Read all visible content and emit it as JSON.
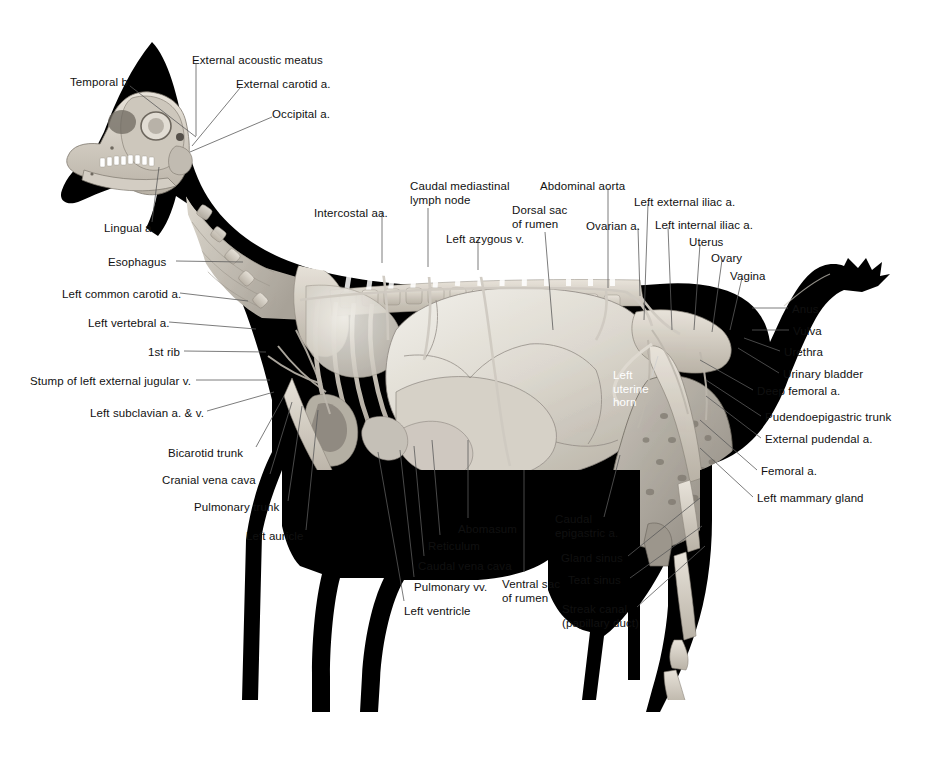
{
  "figure": {
    "view": "left lateral",
    "background_color": "#ffffff",
    "leader_color": "#5a5a5a",
    "text_color": "#111111",
    "white_text_color": "#ffffff"
  },
  "labels": [
    {
      "id": "temporal-b",
      "text": "Temporal b.",
      "x": 70,
      "y": 76,
      "align": "left",
      "tip_x": 196,
      "tip_y": 137,
      "anchor_x": 130,
      "anchor_y": 86
    },
    {
      "id": "external-acoustic-meatus",
      "text": "External acoustic meatus",
      "x": 192,
      "y": 54,
      "align": "left",
      "tip_x": 196,
      "tip_y": 136,
      "anchor_x": 196,
      "anchor_y": 64
    },
    {
      "id": "external-carotid-a",
      "text": "External carotid a.",
      "x": 236,
      "y": 78,
      "align": "left",
      "tip_x": 192,
      "tip_y": 146,
      "anchor_x": 240,
      "anchor_y": 88
    },
    {
      "id": "occipital-a",
      "text": "Occipital a.",
      "x": 272,
      "y": 108,
      "align": "left",
      "tip_x": 190,
      "tip_y": 152,
      "anchor_x": 272,
      "anchor_y": 117
    },
    {
      "id": "lingual-a",
      "text": "Lingual a.",
      "x": 104,
      "y": 222,
      "align": "left",
      "tip_x": 159,
      "tip_y": 167,
      "anchor_x": 152,
      "anchor_y": 222
    },
    {
      "id": "esophagus",
      "text": "Esophagus",
      "x": 108,
      "y": 256,
      "align": "left",
      "tip_x": 243,
      "tip_y": 262,
      "anchor_x": 176,
      "anchor_y": 261
    },
    {
      "id": "left-common-carotid-a",
      "text": "Left common carotid a.",
      "x": 62,
      "y": 288,
      "align": "left",
      "tip_x": 248,
      "tip_y": 301,
      "anchor_x": 180,
      "anchor_y": 293
    },
    {
      "id": "left-vertebral-a",
      "text": "Left vertebral a.",
      "x": 88,
      "y": 317,
      "align": "left",
      "tip_x": 256,
      "tip_y": 329,
      "anchor_x": 169,
      "anchor_y": 322
    },
    {
      "id": "1st-rib",
      "text": "1st rib",
      "x": 148,
      "y": 346,
      "align": "left",
      "tip_x": 266,
      "tip_y": 352,
      "anchor_x": 184,
      "anchor_y": 351
    },
    {
      "id": "stump-left-ext-jugular-v",
      "text": "Stump of left external jugular v.",
      "x": 30,
      "y": 375,
      "align": "left",
      "tip_x": 270,
      "tip_y": 380,
      "anchor_x": 196,
      "anchor_y": 380
    },
    {
      "id": "left-subclavian-a-v",
      "text": "Left subclavian a. & v.",
      "x": 90,
      "y": 407,
      "align": "left",
      "tip_x": 274,
      "tip_y": 392,
      "anchor_x": 207,
      "anchor_y": 411
    },
    {
      "id": "bicarotid-trunk",
      "text": "Bicarotid trunk",
      "x": 168,
      "y": 447,
      "align": "left",
      "tip_x": 284,
      "tip_y": 396,
      "anchor_x": 256,
      "anchor_y": 447
    },
    {
      "id": "cranial-vena-cava",
      "text": "Cranial vena cava",
      "x": 162,
      "y": 474,
      "align": "left",
      "tip_x": 292,
      "tip_y": 402,
      "anchor_x": 270,
      "anchor_y": 474
    },
    {
      "id": "pulmonary-trunk",
      "text": "Pulmonary trunk",
      "x": 194,
      "y": 501,
      "align": "left",
      "tip_x": 302,
      "tip_y": 406,
      "anchor_x": 288,
      "anchor_y": 501
    },
    {
      "id": "left-auricle",
      "text": "Left auricle",
      "x": 246,
      "y": 530,
      "align": "left",
      "tip_x": 318,
      "tip_y": 410,
      "anchor_x": 306,
      "anchor_y": 530
    },
    {
      "id": "intercostal-aa",
      "text": "Intercostal aa.",
      "x": 314,
      "y": 207,
      "align": "left",
      "tip_x": 382,
      "tip_y": 263,
      "anchor_x": 382,
      "anchor_y": 212
    },
    {
      "id": "caudal-mediastinal-lymph-node",
      "text": "Caudal mediastinal\nlymph node",
      "x": 410,
      "y": 180,
      "align": "left",
      "tip_x": 428,
      "tip_y": 267,
      "anchor_x": 428,
      "anchor_y": 208
    },
    {
      "id": "left-azygous-v",
      "text": "Left azygous v.",
      "x": 446,
      "y": 233,
      "align": "left",
      "tip_x": 478,
      "tip_y": 270,
      "anchor_x": 478,
      "anchor_y": 240
    },
    {
      "id": "dorsal-sac-of-rumen",
      "text": "Dorsal sac\nof rumen",
      "x": 512,
      "y": 204,
      "align": "left",
      "tip_x": 553,
      "tip_y": 330,
      "anchor_x": 545,
      "anchor_y": 232
    },
    {
      "id": "abdominal-aorta",
      "text": "Abdominal aorta",
      "x": 540,
      "y": 180,
      "align": "left",
      "tip_x": 608,
      "tip_y": 288,
      "anchor_x": 608,
      "anchor_y": 188
    },
    {
      "id": "ovarian-a",
      "text": "Ovarian a.",
      "x": 586,
      "y": 220,
      "align": "left",
      "tip_x": 640,
      "tip_y": 296,
      "anchor_x": 638,
      "anchor_y": 228
    },
    {
      "id": "left-external-iliac-a",
      "text": "Left external iliac a.",
      "x": 634,
      "y": 196,
      "align": "left",
      "tip_x": 644,
      "tip_y": 320,
      "anchor_x": 648,
      "anchor_y": 204
    },
    {
      "id": "left-internal-iliac-a",
      "text": "Left internal iliac a.",
      "x": 655,
      "y": 219,
      "align": "left",
      "tip_x": 672,
      "tip_y": 330,
      "anchor_x": 668,
      "anchor_y": 227
    },
    {
      "id": "uterus",
      "text": "Uterus",
      "x": 689,
      "y": 236,
      "align": "left",
      "tip_x": 694,
      "tip_y": 330,
      "anchor_x": 700,
      "anchor_y": 244
    },
    {
      "id": "ovary",
      "text": "Ovary",
      "x": 711,
      "y": 252,
      "align": "left",
      "tip_x": 712,
      "tip_y": 332,
      "anchor_x": 722,
      "anchor_y": 260
    },
    {
      "id": "vagina",
      "text": "Vagina",
      "x": 730,
      "y": 270,
      "align": "left",
      "tip_x": 730,
      "tip_y": 330,
      "anchor_x": 742,
      "anchor_y": 278
    },
    {
      "id": "anus",
      "text": "Anus",
      "x": 792,
      "y": 303,
      "align": "left",
      "tip_x": 752,
      "tip_y": 308,
      "anchor_x": 788,
      "anchor_y": 308
    },
    {
      "id": "vulva",
      "text": "Vulva",
      "x": 793,
      "y": 325,
      "align": "left",
      "tip_x": 752,
      "tip_y": 330,
      "anchor_x": 789,
      "anchor_y": 330
    },
    {
      "id": "urethra",
      "text": "Urethra",
      "x": 784,
      "y": 346,
      "align": "left",
      "tip_x": 744,
      "tip_y": 338,
      "anchor_x": 780,
      "anchor_y": 351
    },
    {
      "id": "urinary-bladder",
      "text": "Urinary bladder",
      "x": 783,
      "y": 368,
      "align": "left",
      "tip_x": 738,
      "tip_y": 348,
      "anchor_x": 779,
      "anchor_y": 373
    },
    {
      "id": "deep-femoral-a",
      "text": "Deep femoral a.",
      "x": 757,
      "y": 385,
      "align": "left",
      "tip_x": 700,
      "tip_y": 360,
      "anchor_x": 753,
      "anchor_y": 390
    },
    {
      "id": "pudendoepigastric-trunk",
      "text": "Pudendoepigastric trunk",
      "x": 765,
      "y": 411,
      "align": "left",
      "tip_x": 706,
      "tip_y": 380,
      "anchor_x": 761,
      "anchor_y": 416
    },
    {
      "id": "external-pudendal-a",
      "text": "External pudendal a.",
      "x": 765,
      "y": 433,
      "align": "left",
      "tip_x": 706,
      "tip_y": 396,
      "anchor_x": 761,
      "anchor_y": 438
    },
    {
      "id": "femoral-a",
      "text": "Femoral a.",
      "x": 761,
      "y": 465,
      "align": "left",
      "tip_x": 700,
      "tip_y": 420,
      "anchor_x": 757,
      "anchor_y": 470
    },
    {
      "id": "left-mammary-gland",
      "text": "Left mammary gland",
      "x": 757,
      "y": 492,
      "align": "left",
      "tip_x": 700,
      "tip_y": 448,
      "anchor_x": 753,
      "anchor_y": 497
    },
    {
      "id": "left-uterine-horn",
      "text": "Left\nuterine\nhorn",
      "x": 613,
      "y": 369,
      "align": "left",
      "tip_x": 658,
      "tip_y": 356,
      "anchor_x": 652,
      "anchor_y": 376,
      "white": true
    },
    {
      "id": "caudal-epigastric-a",
      "text": "Caudal\nepigastric a.",
      "x": 555,
      "y": 513,
      "align": "left",
      "tip_x": 620,
      "tip_y": 455,
      "anchor_x": 604,
      "anchor_y": 517
    },
    {
      "id": "gland-sinus",
      "text": "Gland sinus",
      "x": 561,
      "y": 552,
      "align": "left",
      "tip_x": 700,
      "tip_y": 498,
      "anchor_x": 628,
      "anchor_y": 556
    },
    {
      "id": "teat-sinus",
      "text": "Teat sinus",
      "x": 568,
      "y": 574,
      "align": "left",
      "tip_x": 702,
      "tip_y": 526,
      "anchor_x": 630,
      "anchor_y": 578
    },
    {
      "id": "streak-canal",
      "text": "Streak canal\n(papillary duct)",
      "x": 562,
      "y": 603,
      "align": "left",
      "tip_x": 705,
      "tip_y": 546,
      "anchor_x": 637,
      "anchor_y": 607
    },
    {
      "id": "abomasum",
      "text": "Abomasum",
      "x": 458,
      "y": 523,
      "align": "left",
      "tip_x": 468,
      "tip_y": 440,
      "anchor_x": 468,
      "anchor_y": 518
    },
    {
      "id": "reticulum",
      "text": "Reticulum",
      "x": 428,
      "y": 540,
      "align": "left",
      "tip_x": 432,
      "tip_y": 440,
      "anchor_x": 440,
      "anchor_y": 535
    },
    {
      "id": "caudal-vena-cava",
      "text": "Caudal vena cava",
      "x": 418,
      "y": 560,
      "align": "left",
      "tip_x": 414,
      "tip_y": 446,
      "anchor_x": 424,
      "anchor_y": 556
    },
    {
      "id": "pulmonary-vv",
      "text": "Pulmonary vv.",
      "x": 414,
      "y": 581,
      "align": "left",
      "tip_x": 400,
      "tip_y": 450,
      "anchor_x": 414,
      "anchor_y": 577
    },
    {
      "id": "left-ventricle",
      "text": "Left ventricle",
      "x": 404,
      "y": 605,
      "align": "left",
      "tip_x": 378,
      "tip_y": 452,
      "anchor_x": 404,
      "anchor_y": 601
    },
    {
      "id": "ventral-sac-of-rumen",
      "text": "Ventral sac\nof rumen",
      "x": 502,
      "y": 578,
      "align": "left",
      "tip_x": 524,
      "tip_y": 470,
      "anchor_x": 524,
      "anchor_y": 572
    }
  ]
}
